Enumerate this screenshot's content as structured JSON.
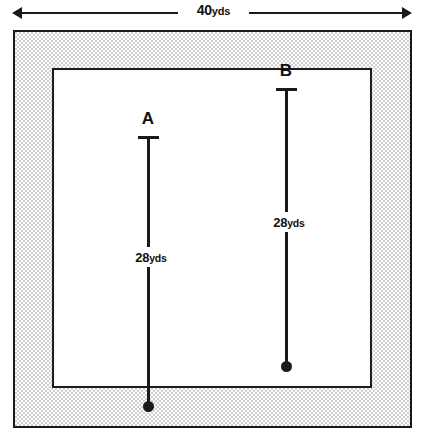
{
  "figure": {
    "colors": {
      "ink": "#1a1a1a",
      "border_fill": "#cfcfcf",
      "interior_fill": "#ffffff",
      "page": "#ffffff"
    }
  },
  "top_dimension": {
    "name": "overall-width",
    "value": "40",
    "unit": "yds",
    "full_label": "40 yds",
    "left_arrow_icon": "arrow-left-icon",
    "right_arrow_icon": "arrow-right-icon"
  },
  "field": {
    "outer_boundary_label": "outer-boundary",
    "border_band_label": "shaded-border-band",
    "inner_boundary_label": "inner-boundary"
  },
  "paths": [
    {
      "id": "A",
      "point_label": "A",
      "length_value": "28",
      "length_unit": "yds",
      "length_label": "28 yds",
      "start_marker": "tee-cap",
      "end_marker": "filled-dot"
    },
    {
      "id": "B",
      "point_label": "B",
      "length_value": "28",
      "length_unit": "yds",
      "length_label": "28 yds",
      "start_marker": "tee-cap",
      "end_marker": "filled-dot"
    }
  ]
}
